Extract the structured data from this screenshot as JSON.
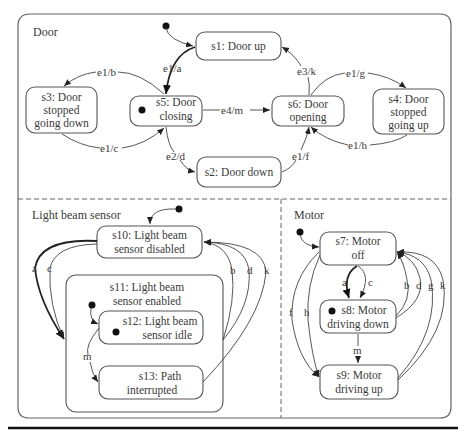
{
  "diagram": {
    "type": "statechart",
    "regions": [
      {
        "name": "Door"
      },
      {
        "name": "Light beam sensor"
      },
      {
        "name": "Motor"
      }
    ],
    "states": {
      "s1": {
        "lines": [
          "s1: Door up"
        ]
      },
      "s2": {
        "lines": [
          "s2: Door down"
        ]
      },
      "s3": {
        "lines": [
          "s3: Door",
          "stopped",
          "going down"
        ]
      },
      "s4": {
        "lines": [
          "s4: Door",
          "stopped",
          "going up"
        ]
      },
      "s5": {
        "lines": [
          "s5: Door",
          "closing"
        ]
      },
      "s6": {
        "lines": [
          "s6: Door",
          "opening"
        ]
      },
      "s7": {
        "lines": [
          "s7: Motor",
          "off"
        ]
      },
      "s8": {
        "lines": [
          "s8: Motor",
          "driving down"
        ]
      },
      "s9": {
        "lines": [
          "s9: Motor",
          "driving up"
        ]
      },
      "s10": {
        "lines": [
          "s10: Light beam",
          "sensor disabled"
        ]
      },
      "s11": {
        "lines": [
          "s11: Light beam",
          "sensor enabled"
        ]
      },
      "s12": {
        "lines": [
          "s12: Light beam",
          "sensor idle"
        ]
      },
      "s13": {
        "lines": [
          "s13: Path",
          "interrupted"
        ]
      }
    },
    "transitions": {
      "door": {
        "s1_s5": "e1/a",
        "s5_s3": "e1/b",
        "s3_s5": "e1/c",
        "s5_s2": "e2/d",
        "s5_s6": "e4/m",
        "s6_s1": "e3/k",
        "s6_s4": "e1/g",
        "s4_s6": "e1/h",
        "s2_s6": "e1/f"
      },
      "sensor": {
        "a": "a",
        "c": "c",
        "b": "b",
        "d": "d",
        "k": "k",
        "m": "m"
      },
      "motor": {
        "a": "a",
        "c": "c",
        "b": "b",
        "d": "d",
        "g": "g",
        "k": "k",
        "f": "f",
        "h": "h",
        "m": "m"
      }
    }
  }
}
